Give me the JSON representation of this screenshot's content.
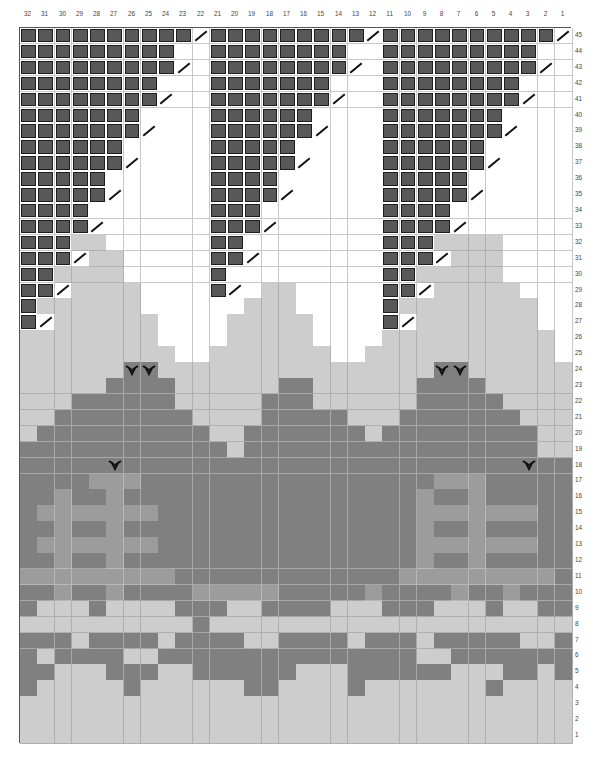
{
  "chart_data": {
    "type": "heatmap",
    "title": "",
    "columns": [
      32,
      31,
      30,
      29,
      28,
      27,
      26,
      25,
      24,
      23,
      22,
      21,
      20,
      19,
      18,
      17,
      16,
      15,
      14,
      13,
      12,
      11,
      10,
      9,
      8,
      7,
      6,
      5,
      4,
      3,
      2,
      1
    ],
    "rows_top_to_bottom": [
      45,
      44,
      43,
      42,
      41,
      40,
      39,
      38,
      37,
      36,
      35,
      34,
      33,
      32,
      31,
      30,
      29,
      28,
      27,
      26,
      25,
      24,
      23,
      22,
      21,
      20,
      19,
      18,
      17,
      16,
      15,
      14,
      13,
      12,
      11,
      10,
      9,
      8,
      7,
      6,
      5,
      4,
      3,
      2,
      1
    ],
    "legend": {
      "D": "dark contrast stitch (boxed)",
      "S": "diagonal slash symbol on white",
      "W": "white",
      "L": "light grey",
      "M": "mid grey",
      "G": "dark grey",
      "V": "motif symbol (V-shape) on dark grey"
    },
    "colors": {
      "W": "#ffffff",
      "L": "#cdcdcd",
      "M": "#9c9c9c",
      "G": "#808080",
      "D": "#585858",
      "outline": "#1e1e1e"
    },
    "grid": [
      "DDDDDDDDDDSDDDDDDDDDSDDDDDDDDDDS",
      "DDDDDDDDDWWDDDDDDDDWWDDDDDDDDDWW",
      "DDDDDDDDDSWDDDDDDDDSWDDDDDDDDDSW",
      "DDDDDDDDWWWDDDDDDDWWWDDDDDDDDWWW",
      "DDDDDDDDSWWDDDDDDDSWWDDDDDDDDSWW",
      "DDDDDDDWWWWDDDDDDWWWWDDDDDDDWWWW",
      "DDDDDDDSWWWDDDDDDSWWWDDDDDDDSWWW",
      "DDDDDDWWWWWDDDDDWWWWWDDDDDDWWWWW",
      "DDDDDDSWWWWDDDDDSWWWWDDDDDDSWWWW",
      "DDDDDWWWWWWDDDDWWWWWWDDDDDWWWWWW",
      "DDDDDSWWWWWDDDDSWWWWWDDDDDSWWWWW",
      "DDDDWWWWWWWDDDWWWWWWWDDDDWWWWWWW",
      "DDDDSWWWWWWDDDSWWWWWWDDDDSWWWWWW",
      "DDDLLWWWWWWDDWWWWWWWWDDDLLLLWWWW",
      "DDDSLLWWWWWDDSWWWWWWWDDDSLLLWWWW",
      "DDLLLLWWWWWDWWWWWWWWWDDLLLLLWWWW",
      "DDSLLLLWWWWDSWLLWWWWWDDSLLLLLWWW",
      "DLLLLLLWWWWWWLLLWWWWWDLLLLLLLLWW",
      "DSLLLLLLWWWWLLLLLWWWWDSLLLLLLLWW",
      "LLLLLLLLWWWWLLLLLWWWWLLLLLLLLLLW",
      "LLLLLLLLLWWLLLLLLLWWLLLLLLLLLLLW",
      "LLLLLLVVLLLLLLLLLLLLLLLLVVLLLLLL",
      "LLLLLGGGGLLLLLLGGLLLLLLGGGGLLLLL",
      "LLLGGGGGGLLLLLGGGLLLLLLGGGGGLLLL",
      "LLGGGGGGGGLLLLGGGGGLLLGGGGGGGLLL",
      "LGGGGGGGGGGLLGGGGGGGLGGGGGGGGGLL",
      "GGGGGGGGGGGGLGGGGGGGGGGGGGGGGGLL",
      "GGGGGVGGGGGGGGGGGGGGGGGGGGGGGVGG",
      "GGGGMMMGGGGGGGGGGGGGGGGGMMMGGGGG",
      "GGMGGMGGGGGGGGGGGGGGGGGMGGMGGGGG",
      "GMMMMMMMGGGGGGGGGGGGGGGMMMMMMMGG",
      "GGMGGMGGGGGGGGGGGGGGGGGMGGMGGGGG",
      "GMMMMMMMGGGGGGGGGGGGGGGMMMMMMMGG",
      "GGMGGMGGGGGGGGGGGGGGGGGMGGMGGGGG",
      "MMMMMMMMMGGGGGGGGGGGGGMMMMMMMMMG",
      "GGMGGMGGGGMMMMMGGGGGMGGGGMGGMGGG",
      "GLLLGLLLLGGGLLGGGGLLLGGGLLLGLLGG",
      "LLLLLLLLLLGLLLLLLLLLLLLLLLLLLLLL",
      "GGGLGGGGLGGGGLLGGGGLGGGLGGGGGLLGG",
      "GLGGGGLLGGGGGGGGGGGGGGGLLGGGGGGG",
      "GGLLLGGGLLGGGGGGLLLGGGGGGLLLGGLG",
      "GLLLLLGLLLLLLGGLLLLGLLLLLLLGLLLL",
      "LLLLLLLLLLLLLLLLLLLLLLLLLLLLLLLL",
      "LLLLLLLLLLLLLLLLLLLLLLLLLLLLLLLL",
      "LLLLLLLLLLLLLLLLLLLLLLLLLLLLLLLL"
    ],
    "motif_cells": [
      {
        "row": 24,
        "col": 26
      },
      {
        "row": 24,
        "col": 25
      },
      {
        "row": 24,
        "col": 8
      },
      {
        "row": 24,
        "col": 7
      },
      {
        "row": 18,
        "col": 27
      },
      {
        "row": 18,
        "col": 3
      }
    ],
    "xlabel": "",
    "ylabel": "",
    "axis_positions": {
      "column_numbers": "top",
      "row_numbers": "right"
    },
    "grid_lines": true
  }
}
